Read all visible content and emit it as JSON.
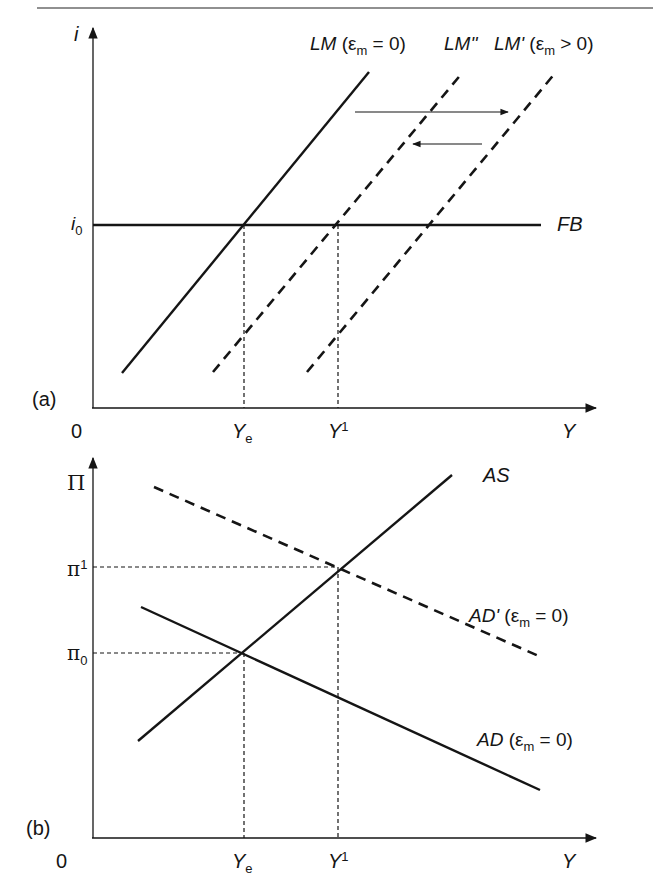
{
  "top_rule": true,
  "panel_a": {
    "tag": "(a)",
    "y_axis_label": "i",
    "x_axis_label": "Y",
    "origin_label": "0",
    "y_tick": {
      "base": "i",
      "sub": "0"
    },
    "x_ticks": [
      {
        "base": "Y",
        "sub": "e",
        "sup": ""
      },
      {
        "base": "Y",
        "sub": "",
        "sup": "1"
      }
    ],
    "curves": {
      "lm": {
        "name": "LM",
        "cond": "(ε",
        "cond_sub": "m",
        "cond_rest": " = 0)"
      },
      "lm2": {
        "name": "LM''"
      },
      "lm1": {
        "name": "LM'",
        "cond": "(ε",
        "cond_sub": "m",
        "cond_rest": " > 0)"
      },
      "fb": {
        "name": "FB"
      }
    }
  },
  "panel_b": {
    "tag": "(b)",
    "y_axis_label": "Π",
    "x_axis_label": "Y",
    "origin_label": "0",
    "y_ticks": [
      {
        "base": "π",
        "sup": "1",
        "sub": ""
      },
      {
        "base": "π",
        "sup": "",
        "sub": "0"
      }
    ],
    "x_ticks": [
      {
        "base": "Y",
        "sub": "e",
        "sup": ""
      },
      {
        "base": "Y",
        "sub": "",
        "sup": "1"
      }
    ],
    "curves": {
      "as": {
        "name": "AS"
      },
      "ad1": {
        "name": "AD'",
        "cond": "(ε",
        "cond_sub": "m",
        "cond_rest": " = 0)"
      },
      "ad": {
        "name": "AD",
        "cond": "(ε",
        "cond_sub": "m",
        "cond_rest": " = 0)"
      }
    }
  },
  "colors": {
    "ink": "#151515",
    "background": "#ffffff"
  }
}
